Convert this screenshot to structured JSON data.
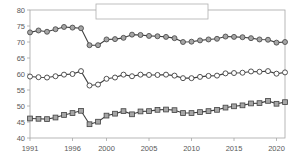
{
  "chart_data": {
    "type": "line",
    "title": "",
    "xlabel": "",
    "ylabel": "",
    "xlim": [
      1991,
      2021
    ],
    "ylim": [
      40,
      80
    ],
    "grid": false,
    "legend_position": "top-center",
    "y_ticks": [
      "40",
      "45",
      "50",
      "55",
      "60",
      "65",
      "70",
      "75",
      "80"
    ],
    "y_tick_values": [
      40,
      45,
      50,
      55,
      60,
      65,
      70,
      75,
      80
    ],
    "x_ticks": [
      "1991",
      "1996",
      "2000",
      "2005",
      "2010",
      "2015",
      "2020"
    ],
    "x_tick_values": [
      1991,
      1996,
      2000,
      2005,
      2010,
      2015,
      2020
    ],
    "x": [
      1991,
      1992,
      1993,
      1994,
      1995,
      1996,
      1997,
      1998,
      1999,
      2000,
      2001,
      2002,
      2003,
      2004,
      2005,
      2006,
      2007,
      2008,
      2009,
      2010,
      2011,
      2012,
      2013,
      2014,
      2015,
      2016,
      2017,
      2018,
      2019,
      2020,
      2021
    ],
    "series": [
      {
        "name": "계",
        "marker": "circle-open",
        "color": "#595959",
        "values": [
          59.2,
          59.0,
          58.9,
          59.3,
          59.8,
          60.0,
          60.9,
          56.4,
          56.7,
          58.5,
          58.9,
          59.8,
          59.3,
          59.8,
          59.7,
          59.7,
          59.8,
          59.5,
          58.7,
          58.7,
          59.1,
          59.4,
          59.5,
          60.2,
          60.3,
          60.4,
          60.8,
          60.7,
          60.9,
          60.1,
          60.5
        ]
      },
      {
        "name": "남자",
        "marker": "circle-filled",
        "color": "#7f7f7f",
        "values": [
          73.0,
          73.6,
          73.2,
          74.0,
          74.7,
          74.5,
          74.3,
          69.0,
          69.0,
          70.8,
          70.9,
          71.3,
          72.3,
          72.2,
          71.9,
          71.8,
          71.6,
          71.2,
          70.0,
          70.1,
          70.5,
          70.8,
          71.0,
          71.7,
          71.6,
          71.5,
          71.2,
          70.8,
          70.7,
          69.8,
          70.0
        ]
      },
      {
        "name": "여자",
        "marker": "square-filled",
        "color": "#7f7f7f",
        "values": [
          46.1,
          46.0,
          45.9,
          46.4,
          47.2,
          47.8,
          48.5,
          44.3,
          45.1,
          47.0,
          47.6,
          48.4,
          47.4,
          48.3,
          48.4,
          48.8,
          48.9,
          48.7,
          47.8,
          47.8,
          48.1,
          48.4,
          48.8,
          49.5,
          49.9,
          50.2,
          50.8,
          50.9,
          51.6,
          50.7,
          51.2
        ]
      }
    ]
  },
  "legend": {
    "items": [
      {
        "label": "계"
      },
      {
        "label": "남자"
      },
      {
        "label": "여자"
      }
    ]
  },
  "axes": {
    "axis_color": "#a6a6a6",
    "label_color": "#595959"
  }
}
